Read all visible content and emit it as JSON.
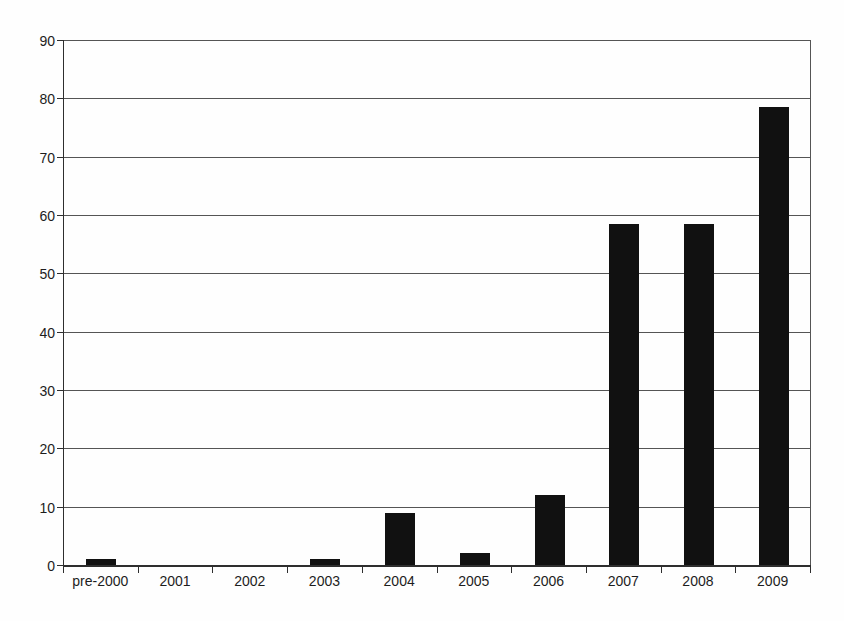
{
  "chart_data": {
    "type": "bar",
    "title": "",
    "xlabel": "",
    "ylabel": "",
    "categories": [
      "pre-2000",
      "2001",
      "2002",
      "2003",
      "2004",
      "2005",
      "2006",
      "2007",
      "2008",
      "2009"
    ],
    "values": [
      1,
      0,
      0,
      1,
      9,
      2,
      12,
      58.5,
      58.5,
      78.5
    ],
    "ylim": [
      0,
      90
    ],
    "yticks": [
      0,
      10,
      20,
      30,
      40,
      50,
      60,
      70,
      80,
      90
    ],
    "grid": true,
    "legend": "none",
    "plot_frame": "top-right-closed",
    "colors": {
      "bar": "#111111",
      "gridline": "#555555",
      "axis": "#2e2e2e",
      "text": "#1d1d1d",
      "background": "#fefefe"
    }
  }
}
